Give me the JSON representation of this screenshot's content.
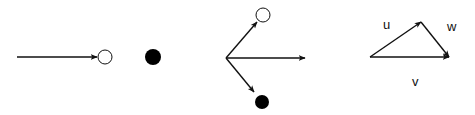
{
  "diagram": {
    "colors": {
      "stroke": "#111111",
      "filled": "#000000",
      "open_fill": "#ffffff"
    },
    "panels": [
      {
        "id": "incoming-particle",
        "elements": [
          {
            "type": "arrow",
            "from": [
              17,
              57
            ],
            "to": [
              97,
              57
            ]
          },
          {
            "type": "open-circle",
            "center": [
              105,
              57
            ],
            "r": 7
          },
          {
            "type": "filled-circle",
            "center": [
              153,
              57
            ],
            "r": 8
          }
        ]
      },
      {
        "id": "scattering",
        "elements": [
          {
            "type": "arrow",
            "from": [
              226,
              58
            ],
            "to": [
              257,
              22
            ]
          },
          {
            "type": "open-circle",
            "center": [
              263,
              15
            ],
            "r": 7
          },
          {
            "type": "arrow",
            "from": [
              226,
              58
            ],
            "to": [
              305,
              58
            ]
          },
          {
            "type": "arrow",
            "from": [
              226,
              58
            ],
            "to": [
              254,
              92
            ]
          },
          {
            "type": "filled-circle",
            "center": [
              262,
              102
            ],
            "r": 7
          }
        ]
      },
      {
        "id": "vector-triangle",
        "elements": [
          {
            "type": "arrow",
            "from": [
              370,
              57
            ],
            "to": [
              421,
              22
            ],
            "label": "u"
          },
          {
            "type": "arrow",
            "from": [
              421,
              22
            ],
            "to": [
              449,
              57
            ],
            "label": "w"
          },
          {
            "type": "arrow",
            "from": [
              370,
              57
            ],
            "to": [
              449,
              57
            ],
            "label": "v"
          }
        ],
        "labels": {
          "u": "u",
          "w": "w",
          "v": "v"
        }
      }
    ]
  }
}
